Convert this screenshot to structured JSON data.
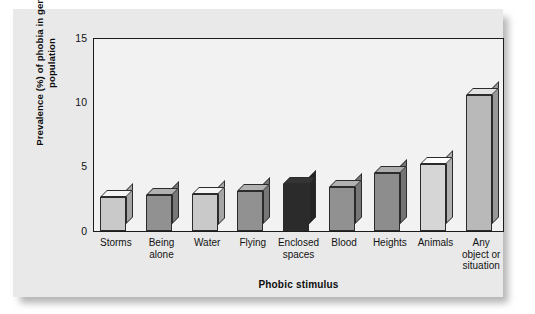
{
  "chart_data": {
    "type": "bar",
    "title": "",
    "xlabel": "Phobic stimulus",
    "ylabel": "Prevalence (%) of phobia in general population",
    "ylabel_line1": "Prevalence (%) of phobia in general",
    "ylabel_line2": "population",
    "ylim": [
      0,
      15
    ],
    "yticks": [
      0,
      5,
      10,
      15
    ],
    "ytick_labels": [
      "0",
      "5",
      "10",
      "15"
    ],
    "grid": false,
    "legend": "none",
    "style": "3d-bar",
    "categories": [
      "Storms",
      "Being alone",
      "Water",
      "Flying",
      "Enclosed spaces",
      "Blood",
      "Heights",
      "Animals",
      "Any object or situation"
    ],
    "category_lines": [
      [
        "Storms"
      ],
      [
        "Being",
        "alone"
      ],
      [
        "Water"
      ],
      [
        "Flying"
      ],
      [
        "Enclosed",
        "spaces"
      ],
      [
        "Blood"
      ],
      [
        "Heights"
      ],
      [
        "Animals"
      ],
      [
        "Any",
        "object or",
        "situation"
      ]
    ],
    "values": [
      2.6,
      2.8,
      2.9,
      3.1,
      3.6,
      3.4,
      4.5,
      5.2,
      10.5
    ],
    "bar_colors": [
      "#c9c9c9",
      "#919191",
      "#c9c9c9",
      "#919191",
      "#2b2b2b",
      "#919191",
      "#8d8d8d",
      "#d6d6d6",
      "#b9b9b9"
    ]
  },
  "colors": {
    "page_background": "#ffffff",
    "card_background": "#e9e9e9",
    "plot_background": "#f2f2f2",
    "axis_line": "#1c1c1c",
    "text": "#111111"
  }
}
